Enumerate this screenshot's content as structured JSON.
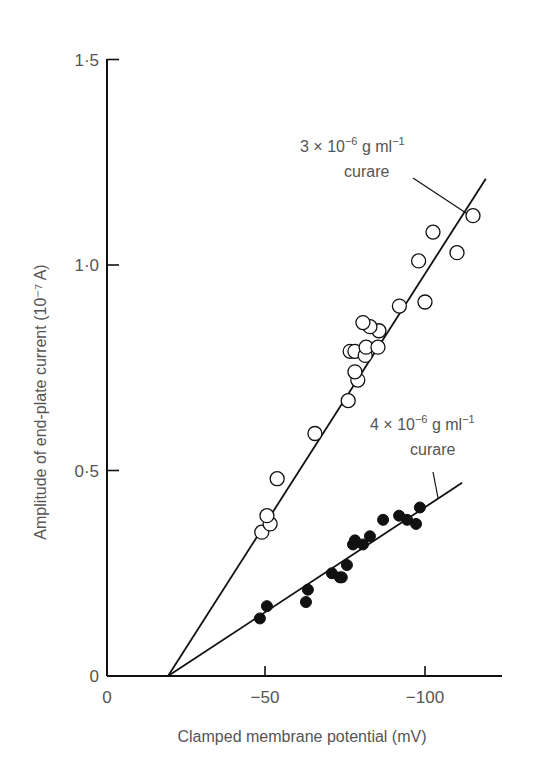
{
  "chart_data": {
    "type": "scatter",
    "title": "",
    "xlabel": "Clamped membrane potential (mV)",
    "ylabel": "Amplitude of end-plate current (10⁻⁷ A)",
    "xlim": [
      0,
      -125
    ],
    "ylim": [
      0,
      1.5
    ],
    "x_ticks": [
      0,
      -50,
      -100
    ],
    "x_tick_labels": [
      "0",
      "−50",
      "−100"
    ],
    "y_ticks": [
      0,
      0.5,
      1.0,
      1.5
    ],
    "y_tick_labels": [
      "0",
      "0·5",
      "1·0",
      "1·5"
    ],
    "grid": false,
    "legend": "none (inline annotations)",
    "series": [
      {
        "name": "3 × 10⁻⁶ g ml⁻¹ curare",
        "marker": "open-circle",
        "fit_line": {
          "x0": -19.7,
          "y0": 0,
          "x1": -119,
          "y1": 1.21
        },
        "points": [
          [
            -49,
            0.35
          ],
          [
            -51.6,
            0.37
          ],
          [
            -50.6,
            0.39
          ],
          [
            -53.8,
            0.48
          ],
          [
            -65.6,
            0.59
          ],
          [
            -76,
            0.67
          ],
          [
            -79,
            0.72
          ],
          [
            -78.1,
            0.74
          ],
          [
            -76.6,
            0.79
          ],
          [
            -78.1,
            0.79
          ],
          [
            -81.3,
            0.78
          ],
          [
            -81.6,
            0.8
          ],
          [
            -85.3,
            0.8
          ],
          [
            -85.6,
            0.84
          ],
          [
            -82.8,
            0.85
          ],
          [
            -80.6,
            0.86
          ],
          [
            -92,
            0.9
          ],
          [
            -100,
            0.91
          ],
          [
            -98,
            1.01
          ],
          [
            -110,
            1.03
          ],
          [
            -102.5,
            1.08
          ],
          [
            -115,
            1.12
          ]
        ]
      },
      {
        "name": "4 × 10⁻⁶ g ml⁻¹ curare",
        "marker": "filled-circle",
        "fit_line": {
          "x0": -19.7,
          "y0": 0,
          "x1": -111.6,
          "y1": 0.47
        },
        "points": [
          [
            -48.4,
            0.14
          ],
          [
            -50.6,
            0.17
          ],
          [
            -62.8,
            0.18
          ],
          [
            -63.4,
            0.21
          ],
          [
            -70.9,
            0.25
          ],
          [
            -73.4,
            0.24
          ],
          [
            -74,
            0.24
          ],
          [
            -75.6,
            0.27
          ],
          [
            -77.5,
            0.32
          ],
          [
            -78.1,
            0.33
          ],
          [
            -80.6,
            0.32
          ],
          [
            -82.8,
            0.34
          ],
          [
            -86.9,
            0.38
          ],
          [
            -91.9,
            0.39
          ],
          [
            -94.4,
            0.38
          ],
          [
            -97.2,
            0.37
          ],
          [
            -98.4,
            0.41
          ]
        ]
      }
    ],
    "annotations": [
      {
        "line1": "3 × 10",
        "exp1": "−6",
        "mid": " g ml",
        "exp2": "−1",
        "line2": "curare",
        "series": 0
      },
      {
        "line1": "4 × 10",
        "exp1": "−6",
        "mid": " g ml",
        "exp2": "−1",
        "line2": "curare",
        "series": 1
      }
    ]
  }
}
